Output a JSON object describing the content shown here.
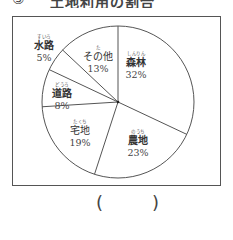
{
  "header": {
    "number": "③",
    "title": "土地利用の割合"
  },
  "chart_data": {
    "type": "pie",
    "title": "",
    "start_angle_deg": 0,
    "direction": "clockwise",
    "slices": [
      {
        "label": "森林",
        "ruby": "しんりん",
        "value": 32,
        "pct_text": "32%"
      },
      {
        "label": "農地",
        "ruby": "のうち",
        "value": 23,
        "pct_text": "23%"
      },
      {
        "label": "宅地",
        "ruby": "たくち",
        "value": 19,
        "pct_text": "19%"
      },
      {
        "label": "道路",
        "ruby": "どうろ",
        "value": 8,
        "pct_text": "8%"
      },
      {
        "label": "水路",
        "ruby": "すいろ",
        "value": 5,
        "pct_text": "5%"
      },
      {
        "label": "その他",
        "ruby": "た",
        "value": 13,
        "pct_text": "13%"
      }
    ],
    "colors": {
      "fill": "#ffffff",
      "stroke": "#555555"
    }
  },
  "answer": {
    "open": "(",
    "close": ")",
    "value": ""
  }
}
